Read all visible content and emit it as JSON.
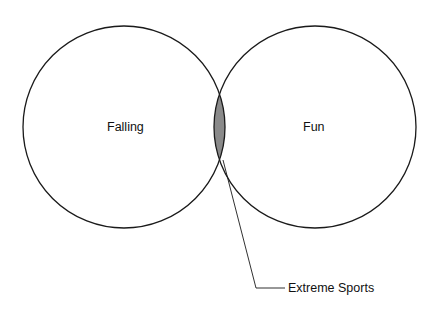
{
  "diagram": {
    "type": "venn",
    "sets": [
      {
        "label": "Falling",
        "cx": 124,
        "cy": 127,
        "r": 101
      },
      {
        "label": "Fun",
        "cx": 315,
        "cy": 127,
        "r": 101
      }
    ],
    "intersection": {
      "label": "Extreme Sports",
      "fill": "#8a8a8a"
    },
    "stroke_color": "#1a1a1a"
  }
}
